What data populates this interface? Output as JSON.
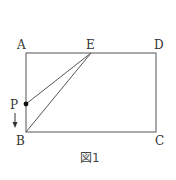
{
  "figure": {
    "caption": "図1",
    "labels": {
      "A": "A",
      "B": "B",
      "C": "C",
      "D": "D",
      "E": "E",
      "P": "P"
    },
    "points": {
      "A": [
        26,
        53
      ],
      "B": [
        26,
        132
      ],
      "C": [
        156,
        132
      ],
      "D": [
        156,
        53
      ],
      "E": [
        91,
        53
      ],
      "P": [
        26,
        104
      ]
    },
    "segments": [
      [
        "A",
        "B"
      ],
      [
        "B",
        "C"
      ],
      [
        "C",
        "D"
      ],
      [
        "D",
        "A"
      ],
      [
        "E",
        "P"
      ],
      [
        "E",
        "B"
      ]
    ],
    "arrow": {
      "direction": "down",
      "meaning": "P moves from A toward B"
    },
    "colors": {
      "line": "#555555",
      "point": "#111111",
      "text": "#333333"
    }
  }
}
